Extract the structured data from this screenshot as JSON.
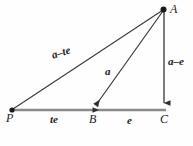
{
  "figure": {
    "type": "geometry-diagram",
    "background_color": "#fefefe",
    "line_color": "#3a3a3a",
    "baseline_color": "#808080",
    "label_color": "#1c1c1c",
    "vertices": [
      {
        "id": "P",
        "label": "P",
        "x": 12,
        "y": 110,
        "dot": true
      },
      {
        "id": "B",
        "label": "B",
        "x": 93,
        "y": 110,
        "dot": false
      },
      {
        "id": "C",
        "label": "C",
        "x": 164,
        "y": 110,
        "dot": false
      },
      {
        "id": "A",
        "label": "A",
        "x": 164,
        "y": 9,
        "dot": true
      }
    ],
    "segments": [
      {
        "id": "PA",
        "from": "P",
        "to": "A",
        "label": "a–te",
        "arrow": "none"
      },
      {
        "id": "AB",
        "from": "A",
        "to": "B",
        "label": "a",
        "arrow": "to-B"
      },
      {
        "id": "AC",
        "from": "A",
        "to": "C",
        "label": "a–e",
        "arrow": "to-C"
      },
      {
        "id": "PB",
        "from": "P",
        "to": "B",
        "label": "te",
        "arrow": "to-B"
      },
      {
        "id": "BC",
        "from": "B",
        "to": "C",
        "label": "e",
        "arrow": "none"
      }
    ],
    "labels": {
      "vertex_P": "P",
      "vertex_B": "B",
      "vertex_C": "C",
      "vertex_A": "A",
      "segment_a_minus_te": "a–te",
      "segment_te": "te",
      "segment_a": "a",
      "segment_e": "e",
      "segment_a_minus_e": "a–e"
    }
  }
}
